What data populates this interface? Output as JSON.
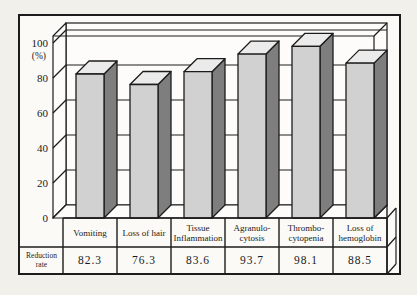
{
  "chart_data": {
    "type": "bar",
    "style": "3d-column",
    "title": "",
    "xlabel": "",
    "ylabel": "(%)",
    "ylim": [
      0,
      100
    ],
    "yticks": [
      0,
      20,
      40,
      60,
      80,
      100
    ],
    "grid": true,
    "legend_position": "none",
    "categories": [
      "Vomiting",
      "Loss of hair",
      "Tissue\nInflammation",
      "Agranulo-\ncytosis",
      "Thrombo-\ncytopenia",
      "Loss of\nhemoglobin"
    ],
    "values": [
      82.3,
      76.3,
      83.6,
      93.7,
      98.1,
      88.5
    ],
    "table_row_header": "Reduction\nrate"
  },
  "colors": {
    "line": "#1c1c1c",
    "wall": "#fdfcfa",
    "paper_inner": "#fbfaf7",
    "bar_front": "#d1d1d1",
    "bar_side": "#7e7e7e",
    "bar_top": "#ebebeb"
  }
}
